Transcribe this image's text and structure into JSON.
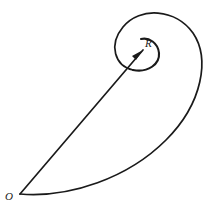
{
  "figure": {
    "name": "spiral-diagram",
    "type": "geometric-diagram",
    "background_color": "#ffffff",
    "stroke_color": "#1a1a1a",
    "width": 217,
    "height": 214,
    "labels": {
      "pole": "O",
      "radius": "R"
    },
    "annotations": {
      "pole_description": "O",
      "radius_description": "R"
    }
  },
  "chart_data": {
    "type": "line",
    "title": "",
    "xlabel": "",
    "ylabel": "",
    "grid": false,
    "legend": false,
    "elements": [
      {
        "name": "outer-spiral-arc",
        "kind": "curve",
        "path": "M 20 194 C 70 198 128 178 166 140 C 203 103 210 58 193 33 C 176 9 140 6 123 27 C 108 45 115 66 133 70"
      },
      {
        "name": "inner-loop-arc",
        "kind": "curve",
        "path": "M 133 70 C 148 73 160 64 159 53 C 158 43 149 37 141 39"
      },
      {
        "name": "radius-vector",
        "kind": "line",
        "x1": 20,
        "y1": 194,
        "x2": 143,
        "y2": 50
      },
      {
        "name": "arrow-head",
        "kind": "polygon",
        "points": "143,50 132,56 136,60"
      }
    ],
    "points": [
      {
        "label": "O",
        "x": 20,
        "y": 194,
        "role": "pole"
      },
      {
        "label": "R",
        "x": 148,
        "y": 44,
        "role": "radius-endpoint"
      }
    ]
  }
}
